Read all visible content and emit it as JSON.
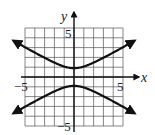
{
  "chart_data": {
    "type": "line",
    "title": "",
    "xlabel": "x",
    "ylabel": "y",
    "xlim": [
      -5,
      5
    ],
    "ylim": [
      -5,
      5
    ],
    "grid": true,
    "tick_labels": {
      "x": [
        "-5",
        "5"
      ],
      "y": [
        "5",
        "-5"
      ]
    },
    "series": [
      {
        "name": "upper branch",
        "description": "Hyperbola branch opening upward, vertex near (0, 0.9), arrows at both ends",
        "x": [
          -6,
          -5,
          -4,
          -3,
          -2,
          -1,
          0,
          1,
          2,
          3,
          4,
          5,
          6
        ],
        "y": [
          3.6,
          3.0,
          2.4,
          1.9,
          1.4,
          1.1,
          0.9,
          1.1,
          1.4,
          1.9,
          2.4,
          3.0,
          3.6
        ]
      },
      {
        "name": "lower branch",
        "description": "Hyperbola branch opening downward, vertex near (0, -0.9), arrows at both ends",
        "x": [
          -6,
          -5,
          -4,
          -3,
          -2,
          -1,
          0,
          1,
          2,
          3,
          4,
          5,
          6
        ],
        "y": [
          -3.6,
          -3.0,
          -2.4,
          -1.9,
          -1.4,
          -1.1,
          -0.9,
          -1.1,
          -1.4,
          -1.9,
          -2.4,
          -3.0,
          -3.6
        ]
      }
    ],
    "equation_hint": "y^2/a^2 - x^2/b^2 = 1 (vertical hyperbola centered at origin)"
  },
  "labels": {
    "x_axis": "x",
    "y_axis": "y",
    "x_neg": "−5",
    "x_pos": "5",
    "y_pos": "5",
    "y_neg": "−5"
  }
}
